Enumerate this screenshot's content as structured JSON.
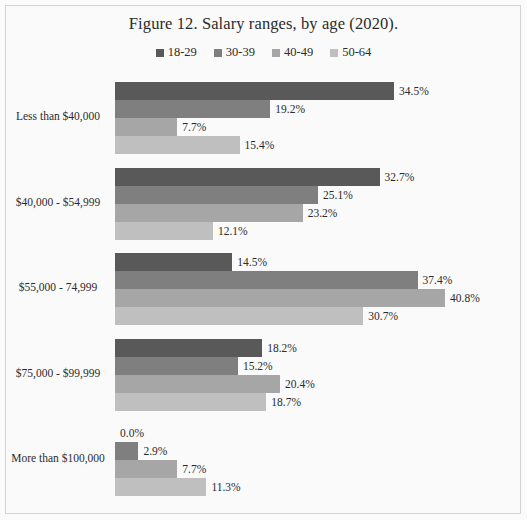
{
  "figure": {
    "title": "Figure 12. Salary ranges, by age (2020)."
  },
  "legend": {
    "position": "top-center",
    "entries": [
      {
        "label": "18-29",
        "color": "#595959"
      },
      {
        "label": "30-39",
        "color": "#7f7f7f"
      },
      {
        "label": "40-49",
        "color": "#a6a6a6"
      },
      {
        "label": "50-64",
        "color": "#bfbfbf"
      }
    ]
  },
  "chart_data": {
    "type": "bar",
    "orientation": "horizontal",
    "title": "Figure 12. Salary ranges, by age (2020).",
    "xlabel": "",
    "ylabel": "",
    "grid": false,
    "legend_position": "top-center",
    "value_suffix": "%",
    "xlim": [
      0,
      40.8
    ],
    "categories": [
      "Less than $40,000",
      "$40,000 - $54,999",
      "$55,000 - 74,999",
      "$75,000 - $99,999",
      "More than $100,000"
    ],
    "series": [
      {
        "name": "18-29",
        "color": "#595959",
        "values": [
          34.5,
          32.7,
          14.5,
          18.2,
          0.0
        ],
        "labels": [
          "34.5%",
          "32.7%",
          "14.5%",
          "18.2%",
          "0.0%"
        ]
      },
      {
        "name": "30-39",
        "color": "#7f7f7f",
        "values": [
          19.2,
          25.1,
          37.4,
          15.2,
          2.9
        ],
        "labels": [
          "19.2%",
          "25.1%",
          "37.4%",
          "15.2%",
          "2.9%"
        ]
      },
      {
        "name": "40-49",
        "color": "#a6a6a6",
        "values": [
          7.7,
          23.2,
          40.8,
          20.4,
          7.7
        ],
        "labels": [
          "7.7%",
          "23.2%",
          "40.8%",
          "20.4%",
          "7.7%"
        ]
      },
      {
        "name": "50-64",
        "color": "#bfbfbf",
        "values": [
          15.4,
          12.1,
          30.7,
          18.7,
          11.3
        ],
        "labels": [
          "15.4%",
          "12.1%",
          "30.7%",
          "18.7%",
          "11.3%"
        ]
      }
    ]
  }
}
